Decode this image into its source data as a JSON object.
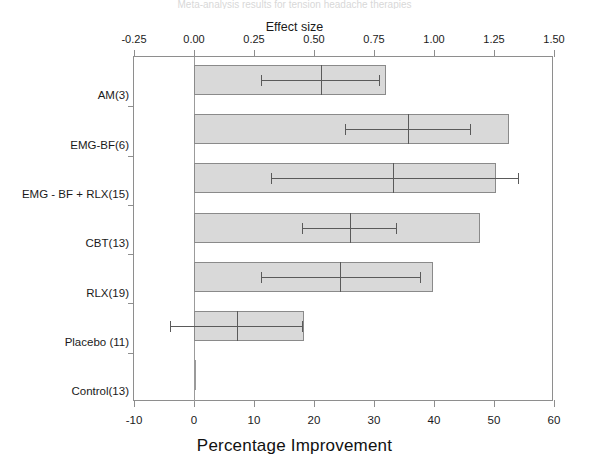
{
  "figure": {
    "title": "Meta-analysis results for tension headache therapies",
    "top_axis_title": "Effect size",
    "bottom_axis_title": "Percentage Improvement"
  },
  "chart_data": {
    "type": "bar",
    "orientation": "horizontal",
    "title": "Meta-analysis results for tension headache therapies",
    "categories": [
      "AM(3)",
      "EMG-BF(6)",
      "EMG - BF  + RLX(15)",
      "CBT(13)",
      "RLX(19)",
      "Placebo (11)",
      "Control(13)"
    ],
    "xlabel": "Percentage Improvement",
    "ylabel": "",
    "xlim": [
      -10,
      60
    ],
    "xticks": [
      -10,
      0,
      10,
      20,
      30,
      40,
      50,
      60
    ],
    "xticklabels": [
      "-10",
      "0",
      "10",
      "20",
      "30",
      "40",
      "50",
      "60"
    ],
    "secondary_xlabel": "Effect size",
    "secondary_xlim": [
      -0.25,
      1.5
    ],
    "secondary_xticks": [
      -0.25,
      0,
      0.25,
      0.5,
      0.75,
      1,
      1.25,
      1.5
    ],
    "secondary_xticklabels": [
      "-0.25",
      "0.00",
      "0.25",
      "0.50",
      "0.75",
      "1.00",
      "1.25",
      "1.50"
    ],
    "grid": false,
    "legend": false,
    "bar_values_percentage_improvement": [
      32.0,
      52.5,
      50.4,
      47.6,
      39.8,
      18.3,
      0.3
    ],
    "effect_size_points": [
      {
        "category": "AM(3)",
        "effect_size": 0.53,
        "ci_low": 0.28,
        "ci_high": 0.77
      },
      {
        "category": "EMG-BF(6)",
        "effect_size": 0.89,
        "ci_low": 0.63,
        "ci_high": 1.15
      },
      {
        "category": "EMG - BF  + RLX(15)",
        "effect_size": 0.83,
        "ci_low": 0.32,
        "ci_high": 1.35
      },
      {
        "category": "CBT(13)",
        "effect_size": 0.65,
        "ci_low": 0.45,
        "ci_high": 0.84
      },
      {
        "category": "RLX(19)",
        "effect_size": 0.61,
        "ci_low": 0.28,
        "ci_high": 0.94
      },
      {
        "category": "Placebo (11)",
        "effect_size": 0.18,
        "ci_low": -0.1,
        "ci_high": 0.45
      },
      {
        "category": "Control(13)",
        "effect_size": null,
        "ci_low": null,
        "ci_high": null
      }
    ],
    "colors": {
      "bar_fill": "#d9d9d9",
      "bar_edge": "#8a8a8a",
      "error_bar": "#5a5a5a",
      "axis": "#8e8e8e",
      "text": "#1a1a1a"
    }
  }
}
